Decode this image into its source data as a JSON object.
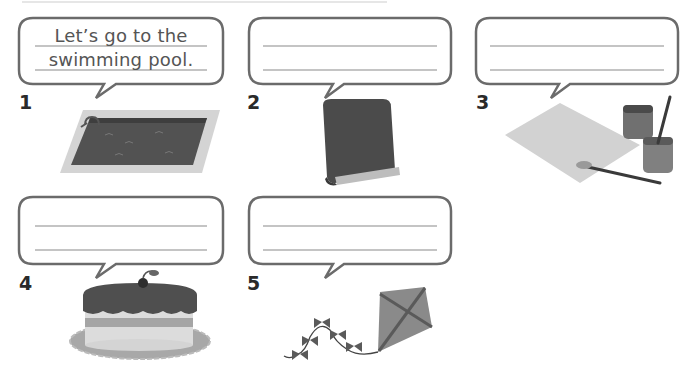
{
  "exercise": {
    "items": [
      {
        "number": "1",
        "picture": "swimming-pool",
        "answer_line1": "Let’s go to the",
        "answer_line2": "swimming pool."
      },
      {
        "number": "2",
        "picture": "book",
        "answer_line1": "",
        "answer_line2": ""
      },
      {
        "number": "3",
        "picture": "paint-and-paper",
        "answer_line1": "",
        "answer_line2": ""
      },
      {
        "number": "4",
        "picture": "cake",
        "answer_line1": "",
        "answer_line2": ""
      },
      {
        "number": "5",
        "picture": "kite",
        "answer_line1": "",
        "answer_line2": ""
      }
    ]
  },
  "colors": {
    "bubble_stroke": "#6b6b6b",
    "rule_line": "#8a8a8a",
    "dark_gray": "#4a4a4a",
    "mid_gray": "#8c8c8c",
    "light_gray": "#cfcfcf"
  }
}
